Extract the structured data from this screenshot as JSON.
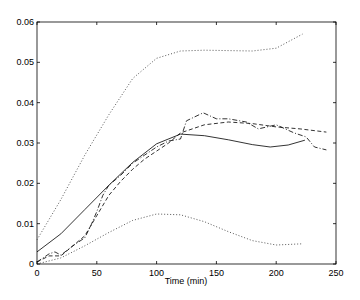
{
  "chart_data": {
    "type": "line",
    "title": "",
    "xlabel": "Time (min)",
    "ylabel": "",
    "xlim": [
      0,
      250
    ],
    "ylim": [
      0,
      0.06
    ],
    "grid": false,
    "legend": null,
    "xticks": [
      0,
      50,
      100,
      150,
      200,
      250
    ],
    "xtick_labels": [
      "0",
      "50",
      "100",
      "150",
      "200",
      "250"
    ],
    "yticks": [
      0,
      0.01,
      0.02,
      0.03,
      0.04,
      0.05,
      0.06
    ],
    "ytick_labels": [
      "0",
      "0.01",
      "0.02",
      "0.03",
      "0.04",
      "0.05",
      "0.06"
    ],
    "series": [
      {
        "name": "fit-solid",
        "style": "solid",
        "x": [
          0,
          20,
          40,
          60,
          80,
          100,
          120,
          140,
          160,
          180,
          195,
          210,
          224
        ],
        "y": [
          0.003,
          0.0075,
          0.0135,
          0.0195,
          0.0252,
          0.0298,
          0.0322,
          0.0318,
          0.0308,
          0.0296,
          0.029,
          0.0295,
          0.0307
        ]
      },
      {
        "name": "upper-bound-dotted",
        "style": "dotted",
        "x": [
          0,
          20,
          40,
          60,
          80,
          100,
          120,
          140,
          160,
          180,
          200,
          222
        ],
        "y": [
          0.006,
          0.016,
          0.027,
          0.037,
          0.046,
          0.051,
          0.0528,
          0.053,
          0.0529,
          0.0528,
          0.0535,
          0.057
        ]
      },
      {
        "name": "lower-bound-dotted",
        "style": "dotted",
        "x": [
          0,
          20,
          40,
          60,
          80,
          100,
          120,
          140,
          160,
          180,
          200,
          222
        ],
        "y": [
          0.0,
          0.0015,
          0.0045,
          0.0078,
          0.0108,
          0.0124,
          0.0122,
          0.0105,
          0.008,
          0.0058,
          0.0047,
          0.005
        ]
      },
      {
        "name": "data-dashed",
        "style": "dashed",
        "x": [
          0,
          10,
          20,
          30,
          40,
          50,
          60,
          70,
          80,
          90,
          100,
          110,
          120,
          140,
          160,
          180,
          200,
          220,
          242
        ],
        "y": [
          0.0005,
          0.002,
          0.002,
          0.0045,
          0.007,
          0.012,
          0.017,
          0.0205,
          0.0235,
          0.026,
          0.028,
          0.03,
          0.0325,
          0.0345,
          0.0352,
          0.0348,
          0.034,
          0.0335,
          0.0327
        ]
      },
      {
        "name": "data-dashdot",
        "style": "dashdot",
        "x": [
          0,
          10,
          15,
          20,
          30,
          40,
          45,
          50,
          55,
          60,
          70,
          80,
          90,
          100,
          110,
          120,
          125,
          139,
          150,
          160,
          175,
          185,
          200,
          215,
          225,
          232,
          242
        ],
        "y": [
          0.0005,
          0.0025,
          0.003,
          0.0022,
          0.0045,
          0.0065,
          0.0095,
          0.013,
          0.017,
          0.0195,
          0.022,
          0.025,
          0.027,
          0.029,
          0.0305,
          0.031,
          0.0355,
          0.0375,
          0.036,
          0.036,
          0.0352,
          0.0335,
          0.0345,
          0.0325,
          0.0315,
          0.029,
          0.0283
        ]
      }
    ]
  },
  "plot": {
    "line_color": "#000000",
    "dotted_color": "#444444",
    "background": "#ffffff"
  }
}
